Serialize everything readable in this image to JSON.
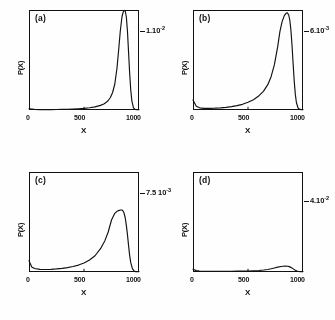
{
  "figure": {
    "type": "multi-panel-line-plot",
    "panels": 4,
    "layout": "2x2 grid"
  },
  "axis": {
    "xlabel": "X",
    "ylabel": "P(X)",
    "xticks": [
      "0",
      "500",
      "1000"
    ],
    "xtick_values": [
      0,
      500,
      1000
    ],
    "xlim": [
      0,
      1000
    ],
    "grid": false
  },
  "panels": [
    {
      "letter": "(a)",
      "scale_mantissa": "1.10",
      "scale_exponent": "-2",
      "scale_label": "1.10-2"
    },
    {
      "letter": "(b)",
      "scale_mantissa": "6.10",
      "scale_exponent": "-3",
      "scale_label": "6.10-3"
    },
    {
      "letter": "(c)",
      "scale_mantissa": "7.5 10",
      "scale_exponent": "-3",
      "scale_label": "7.5 10-3"
    },
    {
      "letter": "(d)",
      "scale_mantissa": "4.10",
      "scale_exponent": "-2",
      "scale_label": "4.10-2"
    }
  ],
  "chart_data": [
    {
      "type": "line",
      "title": "(a)",
      "xlabel": "X",
      "ylabel": "P(X)",
      "xlim": [
        0,
        1000
      ],
      "ylim": [
        0,
        0.01
      ],
      "ymax_label": "1.10-2",
      "ytick_labels": [
        "1.10-2"
      ],
      "xtick_labels": [
        "0",
        "500",
        "1000"
      ],
      "grid": false,
      "legend": "none",
      "description": "Very sharp narrow unimodal peak near X=870 rising to near full scale; flat near-zero elsewhere.",
      "x": [
        0,
        50,
        100,
        150,
        200,
        250,
        300,
        350,
        400,
        450,
        500,
        550,
        600,
        650,
        680,
        700,
        720,
        740,
        760,
        780,
        800,
        815,
        830,
        845,
        855,
        865,
        870,
        875,
        885,
        895,
        905,
        915,
        925,
        935,
        950,
        965,
        980,
        1000
      ],
      "y": [
        0.00012,
        6e-05,
        4e-05,
        4e-05,
        4e-05,
        5e-05,
        6e-05,
        7e-05,
        9e-05,
        0.00012,
        0.00016,
        0.00022,
        0.00031,
        0.00046,
        0.0006,
        0.00074,
        0.00095,
        0.00125,
        0.00175,
        0.0026,
        0.0042,
        0.006,
        0.0079,
        0.0093,
        0.00975,
        0.00995,
        0.01,
        0.0099,
        0.0093,
        0.0079,
        0.0058,
        0.0037,
        0.002,
        0.00092,
        0.00022,
        6e-05,
        2e-05,
        1e-05
      ]
    },
    {
      "type": "line",
      "title": "(b)",
      "xlabel": "X",
      "ylabel": "P(X)",
      "xlim": [
        0,
        1000
      ],
      "ylim": [
        0,
        0.006
      ],
      "ymax_label": "6.10-3",
      "ytick_labels": [
        "6.10-3"
      ],
      "xtick_labels": [
        "0",
        "500",
        "1000"
      ],
      "grid": false,
      "legend": "none",
      "description": "Tall right-skewed peak near X=860 reaching about 85 percent of frame height, steep fall on the right, long shallow left tail.",
      "x": [
        0,
        30,
        60,
        100,
        150,
        200,
        250,
        300,
        350,
        400,
        450,
        500,
        550,
        600,
        640,
        680,
        710,
        740,
        770,
        790,
        810,
        830,
        845,
        858,
        870,
        880,
        890,
        900,
        910,
        920,
        930,
        940,
        955,
        970,
        985,
        1000
      ],
      "y": [
        0.0006,
        0.00022,
        0.00013,
        0.0001,
        0.0001,
        0.00011,
        0.00013,
        0.00016,
        0.0002,
        0.00026,
        0.00034,
        0.00046,
        0.00062,
        0.00086,
        0.00112,
        0.00152,
        0.002,
        0.00272,
        0.0038,
        0.0047,
        0.0053,
        0.00566,
        0.0058,
        0.00583,
        0.0057,
        0.0054,
        0.0048,
        0.0039,
        0.0028,
        0.00175,
        0.00095,
        0.00045,
        0.00012,
        4e-05,
        2e-05,
        2e-05
      ]
    },
    {
      "type": "line",
      "title": "(c)",
      "xlabel": "X",
      "ylabel": "P(X)",
      "xlim": [
        0,
        1000
      ],
      "ylim": [
        0,
        0.0075
      ],
      "ymax_label": "7.5 10-3",
      "ytick_labels": [
        "7.5 10-3"
      ],
      "xtick_labels": [
        "0",
        "500",
        "1000"
      ],
      "grid": false,
      "legend": "none",
      "description": "Broad right-skewed peak near X=845 reaching about 62 percent of frame height with a long shallow left tail and steep right drop.",
      "x": [
        0,
        25,
        50,
        100,
        150,
        200,
        250,
        300,
        350,
        400,
        450,
        500,
        550,
        600,
        650,
        690,
        720,
        750,
        780,
        800,
        820,
        835,
        845,
        855,
        865,
        875,
        885,
        895,
        905,
        915,
        925,
        940,
        955,
        970,
        985,
        1000
      ],
      "y": [
        0.00085,
        0.00038,
        0.00026,
        0.0002,
        0.00019,
        0.0002,
        0.00023,
        0.00027,
        0.00033,
        0.00041,
        0.00052,
        0.00068,
        0.0009,
        0.00122,
        0.00175,
        0.00235,
        0.003,
        0.0039,
        0.0044,
        0.00455,
        0.00462,
        0.00465,
        0.00465,
        0.00458,
        0.0044,
        0.00405,
        0.0035,
        0.0028,
        0.002,
        0.00125,
        0.0007,
        0.00025,
        8e-05,
        3e-05,
        2e-05,
        2e-05
      ]
    },
    {
      "type": "line",
      "title": "(d)",
      "xlabel": "X",
      "ylabel": "P(X)",
      "xlim": [
        0,
        1000
      ],
      "ylim": [
        0,
        0.04
      ],
      "ymax_label": "4.10-2",
      "ytick_labels": [
        "4.10-2"
      ],
      "xtick_labels": [
        "0",
        "500",
        "1000"
      ],
      "grid": false,
      "legend": "none",
      "description": "Very low broad bump centered near X=830 reaching only about 12 percent of frame height; nearly flat across most of the range.",
      "x": [
        0,
        30,
        60,
        100,
        150,
        200,
        250,
        300,
        350,
        400,
        450,
        500,
        550,
        600,
        640,
        680,
        710,
        740,
        770,
        800,
        820,
        840,
        860,
        875,
        890,
        900,
        915,
        930,
        945,
        960,
        975,
        1000
      ],
      "y": [
        0.0011,
        0.00055,
        0.0004,
        0.00032,
        0.00028,
        0.00027,
        0.00027,
        0.00028,
        0.0003,
        0.00033,
        0.00037,
        0.00042,
        0.0005,
        0.00062,
        0.00078,
        0.00102,
        0.00128,
        0.0016,
        0.00195,
        0.00222,
        0.00232,
        0.00236,
        0.0023,
        0.00215,
        0.00185,
        0.0016,
        0.00115,
        0.00072,
        0.0004,
        0.00022,
        0.00012,
        8e-05
      ]
    }
  ]
}
